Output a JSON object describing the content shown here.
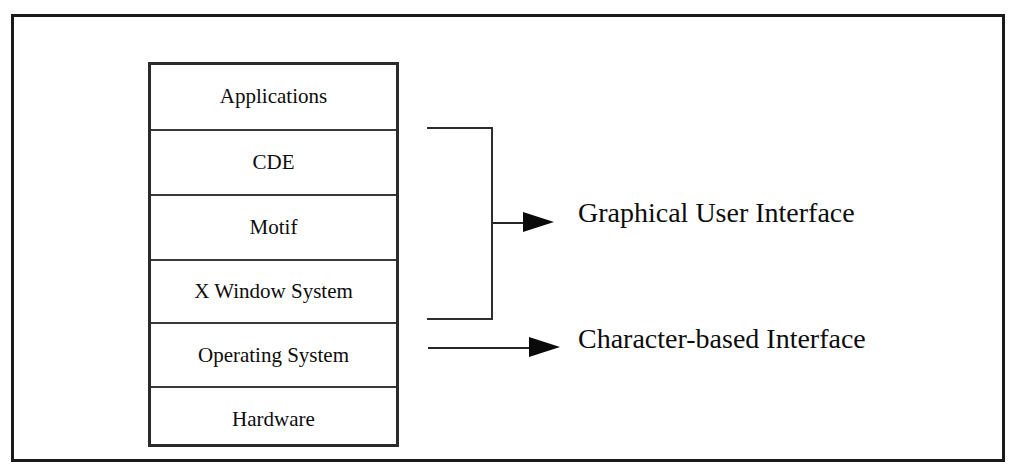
{
  "diagram": {
    "frame": {
      "border_color": "#1a1a1a"
    },
    "stack": {
      "name": "software-layer-stack",
      "border_color": "#2b2b2b",
      "layers": [
        {
          "label": "Applications",
          "key": "applications"
        },
        {
          "label": "CDE",
          "key": "cde"
        },
        {
          "label": "Motif",
          "key": "motif"
        },
        {
          "label": "X Window System",
          "key": "x-window-system"
        },
        {
          "label": "Operating System",
          "key": "operating-system"
        },
        {
          "label": "Hardware",
          "key": "hardware"
        }
      ]
    },
    "annotations": [
      {
        "key": "graphical-user-interface",
        "label": "Graphical User Interface",
        "connector": "bracket-arrow",
        "groups": [
          "CDE",
          "Motif",
          "X Window System"
        ]
      },
      {
        "key": "character-based-interface",
        "label": "Character-based Interface",
        "connector": "arrow",
        "groups": [
          "Operating System"
        ]
      }
    ],
    "colors": {
      "background": "#ffffff",
      "line": "#2e2e2e",
      "arrow": "#0a0a0a",
      "text": "#0d0d0d"
    }
  }
}
